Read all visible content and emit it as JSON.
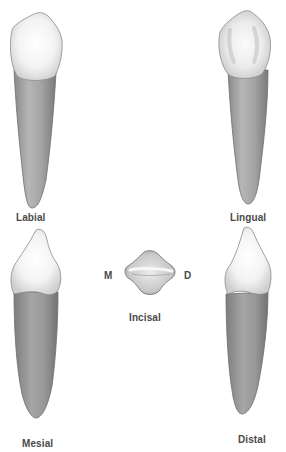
{
  "diagram": {
    "title": "",
    "colors": {
      "crown_fill": "#f4f4f4",
      "crown_shadow": "#c8c8c8",
      "root_fill": "#a8a8a8",
      "root_dark": "#7c7c7c",
      "outline": "#6a6a6a",
      "label_text": "#4a4a4a",
      "background": "#ffffff"
    },
    "views": [
      {
        "id": "labial",
        "label": "Labial",
        "position": "top-left"
      },
      {
        "id": "lingual",
        "label": "Lingual",
        "position": "top-right"
      },
      {
        "id": "mesial",
        "label": "Mesial",
        "position": "bottom-left"
      },
      {
        "id": "incisal",
        "label": "Incisal",
        "position": "center"
      },
      {
        "id": "distal",
        "label": "Distal",
        "position": "bottom-right"
      }
    ],
    "orientation_markers": {
      "left": "M",
      "right": "D"
    }
  }
}
